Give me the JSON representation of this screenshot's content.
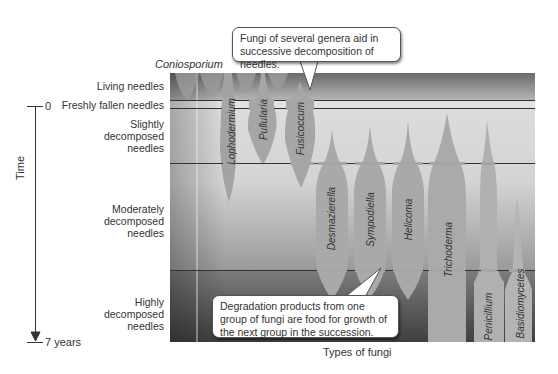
{
  "title_label": "Coniosporium",
  "time_axis": {
    "label": "Time",
    "start_tick": "0",
    "end_tick": "7 years"
  },
  "x_axis_label": "Types of fungi",
  "stages": [
    {
      "label": "Living needles"
    },
    {
      "label": "Freshly fallen needles"
    },
    {
      "label": "Slightly\ndecomposed\nneedles"
    },
    {
      "label": "Moderately\ndecomposed\nneedles"
    },
    {
      "label": "Highly\ndecomposed\nneedles"
    }
  ],
  "fungi": [
    {
      "name": "Coniosporium"
    },
    {
      "name": "Lophodermium"
    },
    {
      "name": "Pullularia"
    },
    {
      "name": "Fusicoccum"
    },
    {
      "name": "Desmazierella"
    },
    {
      "name": "Sympodiella"
    },
    {
      "name": "Helicoma"
    },
    {
      "name": "Trichoderma"
    },
    {
      "name": "Penicillium"
    },
    {
      "name": "Basidiomycetes"
    }
  ],
  "callouts": {
    "top": "Fungi of several genera aid in successive decomposition of needles.",
    "bottom": "Degradation products from one group of fungi are food for growth of the next group in the succession."
  },
  "colors": {
    "fungus_fill": "#a9a9a9",
    "band_light": "#d8d8d8",
    "band_dark": "#555555",
    "line": "#333333"
  }
}
